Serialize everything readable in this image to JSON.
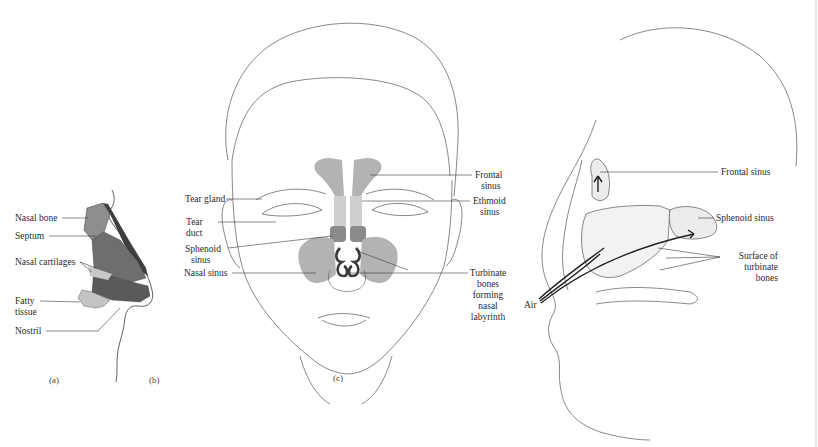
{
  "figure": {
    "panels": [
      {
        "id": "a",
        "letter": "(a)",
        "labels": {
          "nasal_bone": "Nasal bone",
          "septum": "Septum",
          "nasal_cartilages": "Nasal cartilages",
          "fatty_tissue_1": "Fatty",
          "fatty_tissue_2": "tissue",
          "nostril": "Nostril"
        }
      },
      {
        "id": "b",
        "letter": "(b)",
        "labels": {
          "tear_gland": "Tear gland",
          "tear_duct_1": "Tear",
          "tear_duct_2": "duct",
          "sphenoid_sinus_1": "Sphenoid",
          "sphenoid_sinus_2": "sinus",
          "nasal_sinus": "Nasal sinus",
          "frontal_sinus_1": "Frontal",
          "frontal_sinus_2": "sinus",
          "ethmoid_sinus_1": "Ethmoid",
          "ethmoid_sinus_2": "sinus",
          "turbinate_1": "Turbinate",
          "turbinate_2": "bones",
          "turbinate_3": "forming",
          "turbinate_4": "nasal",
          "turbinate_5": "labyrinth"
        }
      },
      {
        "id": "c",
        "letter": "(c)",
        "labels": {
          "frontal_sinus": "Frontal sinus",
          "sphenoid_sinus": "Sphenoid sinus",
          "surface_1": "Surface of",
          "surface_2": "turbinate",
          "surface_3": "bones",
          "air": "Air"
        }
      }
    ],
    "colors": {
      "line": "#3a3a3a",
      "sinus_gray": "#b3b3b3",
      "dark_gray": "#5e5e5e",
      "mid_gray": "#8a8a8a",
      "light_gray": "#cfcfcf"
    }
  }
}
